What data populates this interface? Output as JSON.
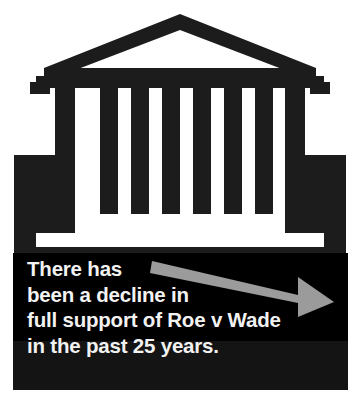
{
  "graphic": {
    "title": "There has been a decline in full support of Roe v Wade in the past 25 years.",
    "type": "illustrated-infographic-callout",
    "colors": {
      "background": "#ffffff",
      "building_dark": "#1c1c1c",
      "panel_black": "#000000",
      "panel_black_lower": "#141414",
      "text_white": "#f2f2f2",
      "arrow_gray": "#9b9b9b",
      "arrow_gray_light": "#b4b4b4"
    }
  },
  "illustration": {
    "name": "supreme-court-building",
    "description": "Stylized courthouse facade with triangular pediment, six columns and a stepped base",
    "column_count": 6,
    "pediment": "outline-triangle",
    "base": "stepped-plinth"
  },
  "caption": {
    "lines": [
      "There has",
      "been a decline in",
      "full support of Roe v Wade",
      "in the past 25 years."
    ],
    "full_text": "There has been a decline in full support of Roe v Wade in the past 25 years."
  },
  "arrow": {
    "name": "downward-trend-arrow",
    "direction": "down-right",
    "meaning": "decline",
    "color": "#9b9b9b"
  }
}
